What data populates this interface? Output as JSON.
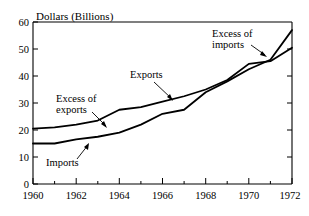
{
  "chart_data": {
    "type": "line",
    "title": "",
    "ylabel": "Dollars (Billions)",
    "xlabel": "",
    "xlim": [
      1960,
      1972
    ],
    "ylim": [
      0,
      60
    ],
    "grid": false,
    "legend_position": "inline-annotations",
    "x": [
      1960,
      1961,
      1962,
      1963,
      1964,
      1965,
      1966,
      1967,
      1968,
      1969,
      1970,
      1971,
      1972
    ],
    "y_ticks": [
      0,
      10,
      20,
      30,
      40,
      50,
      60
    ],
    "y_tick_labels": [
      "0",
      "10",
      "20",
      "30",
      "40",
      "50",
      "60"
    ],
    "x_ticks": [
      1960,
      1961,
      1962,
      1963,
      1964,
      1965,
      1966,
      1967,
      1968,
      1969,
      1970,
      1971,
      1972
    ],
    "x_tick_labels": [
      "1960",
      "",
      "1962",
      "",
      "1964",
      "",
      "1966",
      "",
      "1968",
      "",
      "1970",
      "",
      "1972"
    ],
    "x_major_ticks": [
      1960,
      1962,
      1964,
      1966,
      1968,
      1970,
      1972
    ],
    "series": [
      {
        "name": "Exports",
        "values": [
          20.5,
          21.0,
          22.0,
          23.5,
          27.5,
          28.5,
          30.5,
          32.5,
          35.0,
          38.5,
          44.5,
          45.5,
          50.5
        ]
      },
      {
        "name": "Imports",
        "values": [
          15.0,
          15.0,
          16.5,
          17.5,
          19.0,
          22.0,
          26.0,
          27.5,
          34.0,
          38.0,
          42.5,
          46.0,
          57.0
        ]
      }
    ],
    "annotations": [
      {
        "id": "excess-of-exports",
        "text_line1": "Excess of",
        "text_line2": "exports",
        "points_to": "gap between exports and imports near 1963-1964"
      },
      {
        "id": "exports",
        "text_line1": "Exports",
        "text_line2": "",
        "points_to": "exports curve near 1966-1967"
      },
      {
        "id": "imports",
        "text_line1": "Imports",
        "text_line2": "",
        "points_to": "imports curve near 1962-1963"
      },
      {
        "id": "excess-of-imports",
        "text_line1": "Excess of",
        "text_line2": "imports",
        "points_to": "gap above crossing near 1971-1972"
      }
    ]
  },
  "axis": {
    "y_title": "Dollars (Billions)"
  },
  "ticks": {
    "y": [
      "60",
      "50",
      "40",
      "30",
      "20",
      "10",
      "0"
    ],
    "x": [
      "1960",
      "1962",
      "1964",
      "1966",
      "1968",
      "1970",
      "1972"
    ]
  },
  "annotations": {
    "excess_exports_l1": "Excess of",
    "excess_exports_l2": "exports",
    "exports": "Exports",
    "imports": "Imports",
    "excess_imports_l1": "Excess of",
    "excess_imports_l2": "imports"
  },
  "colors": {
    "line": "#000000",
    "background": "#ffffff",
    "axis": "#000000"
  }
}
